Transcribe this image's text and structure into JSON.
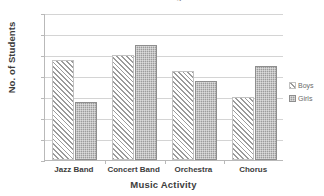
{
  "chart_data": {
    "type": "bar",
    "title": "Students in Music Programs",
    "xlabel": "Music Activity",
    "ylabel": "No. of Students",
    "categories": [
      "Jazz Band",
      "Concert Band",
      "Orchestra",
      "Chorus"
    ],
    "series": [
      {
        "name": "Boys",
        "values": [
          19,
          20,
          17,
          12
        ]
      },
      {
        "name": "Girls",
        "values": [
          11,
          22,
          15,
          18
        ]
      }
    ],
    "ylim": [
      0,
      28
    ],
    "yticks": [
      0,
      4,
      8,
      12,
      16,
      20,
      24,
      28
    ],
    "ytick_labels": [
      "0",
      "4",
      "8",
      "12",
      "16",
      "20",
      "24",
      "28"
    ],
    "grid": true,
    "legend_position": "right",
    "legend": [
      {
        "label": "Boys",
        "pattern": "diagonal-hatch",
        "color": "#9b9b9b"
      },
      {
        "label": "Girls",
        "pattern": "stipple-fill",
        "color": "#9c9c9c"
      }
    ],
    "colors": {
      "boys": "#9b9b9b",
      "girls": "#9c9c9c",
      "grid": "#d4d4d4",
      "axis": "#b9b9b9",
      "text": "#3d3d3d"
    }
  }
}
